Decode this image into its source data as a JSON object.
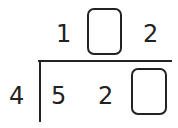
{
  "division": {
    "divisor": "4",
    "dividend": [
      "5",
      "2",
      ""
    ],
    "quotient": [
      "1",
      "",
      "2"
    ],
    "blanks": [
      "quotient-tens",
      "dividend-ones"
    ]
  }
}
